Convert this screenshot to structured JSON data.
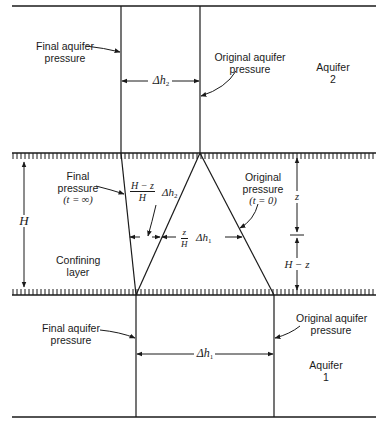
{
  "figure": {
    "aquifer2": {
      "label_line1": "Aquifer",
      "label_line2": "2",
      "final_pressure_line1": "Final aquifer",
      "final_pressure_line2": "pressure",
      "original_pressure_line1": "Original aquifer",
      "original_pressure_line2": "pressure",
      "delta_h": "Δh",
      "delta_h_sub": "2"
    },
    "confining_layer": {
      "label_line1": "Confining",
      "label_line2": "layer",
      "thickness": "H",
      "final_pressure_line1": "Final",
      "final_pressure_line2": "pressure",
      "final_pressure_line3": "(t = ∞)",
      "original_pressure_line1": "Original",
      "original_pressure_line2": "pressure",
      "original_pressure_line3": "(t = 0)",
      "frac_h2_num": "H − z",
      "frac_h2_den": "H",
      "frac_h2_term": "Δh",
      "frac_h2_sub": "2",
      "frac_h1_num": "z",
      "frac_h1_den": "H",
      "frac_h1_term": "Δh",
      "frac_h1_sub": "1",
      "z_label": "z",
      "h_minus_z_label": "H − z"
    },
    "aquifer1": {
      "label_line1": "Aquifer",
      "label_line2": "1",
      "final_pressure_line1": "Final aquifer",
      "final_pressure_line2": "pressure",
      "original_pressure_line1": "Original aquifer",
      "original_pressure_line2": "pressure",
      "delta_h": "Δh",
      "delta_h_sub": "1"
    }
  }
}
